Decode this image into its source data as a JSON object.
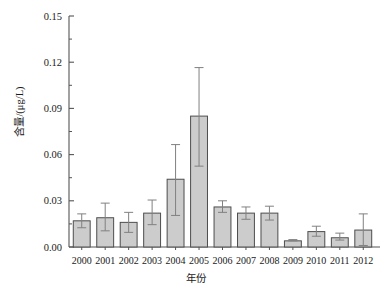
{
  "chart_data": {
    "type": "bar",
    "title": "",
    "subtitle": "",
    "xlabel": "年份",
    "ylabel": "含量/(μg/L)",
    "categories": [
      "2000",
      "2001",
      "2002",
      "2003",
      "2004",
      "2005",
      "2006",
      "2007",
      "2008",
      "2009",
      "2010",
      "2011",
      "2012"
    ],
    "values": [
      0.017,
      0.019,
      0.016,
      0.022,
      0.044,
      0.085,
      0.026,
      0.022,
      0.022,
      0.004,
      0.01,
      0.006,
      0.011
    ],
    "error_low": [
      0.0125,
      0.0105,
      0.0095,
      0.0145,
      0.0205,
      0.0525,
      0.0225,
      0.018,
      0.0175,
      0.004,
      0.007,
      0.0045,
      0.001
    ],
    "error_high": [
      0.0215,
      0.0285,
      0.0225,
      0.0305,
      0.0665,
      0.1165,
      0.03,
      0.026,
      0.0265,
      0.0048,
      0.0135,
      0.009,
      0.0215
    ],
    "ylim": [
      0.0,
      0.15
    ],
    "yticks": [
      0.0,
      0.03,
      0.06,
      0.09,
      0.12,
      0.15
    ],
    "ytick_labels": [
      "0.00",
      "0.03",
      "0.06",
      "0.09",
      "0.12",
      "0.15"
    ],
    "yminor_step": 0.015,
    "grid": false,
    "legend": null,
    "legend_position": "none",
    "bar_fill": "#cccccc",
    "bar_edge": "#4d4d4d",
    "axis_color": "#555555",
    "error_color": "#808080",
    "error_bars": true
  },
  "figure": {
    "background": "#ffffff"
  }
}
